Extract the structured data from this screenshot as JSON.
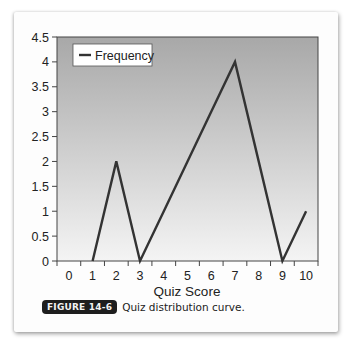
{
  "figure": {
    "badge": "FIGURE 14-6",
    "caption": "Quiz distribution curve."
  },
  "colors": {
    "line": "#333333",
    "plot_bg_top": "#a8a8a8",
    "plot_bg_bottom": "#f4f4f4",
    "badge_bg": "#1e1e1e"
  },
  "chart_data": {
    "type": "line",
    "title": "",
    "xlabel": "Quiz Score",
    "ylabel": "",
    "categories": [
      "0",
      "1",
      "2",
      "3",
      "4",
      "5",
      "6",
      "7",
      "8",
      "9",
      "10"
    ],
    "series": [
      {
        "name": "Frequency",
        "values": [
          null,
          0,
          2,
          0,
          1,
          2,
          3,
          4,
          2,
          0,
          1
        ]
      }
    ],
    "ylim": [
      0,
      4.5
    ],
    "yticks": [
      "0",
      "0.5",
      "1",
      "1.5",
      "2",
      "2.5",
      "3",
      "3.5",
      "4",
      "4.5"
    ],
    "grid": false,
    "legend": {
      "position": "top-left-inside",
      "entries": [
        "Frequency"
      ]
    },
    "background": "vertical gradient gray to white"
  }
}
